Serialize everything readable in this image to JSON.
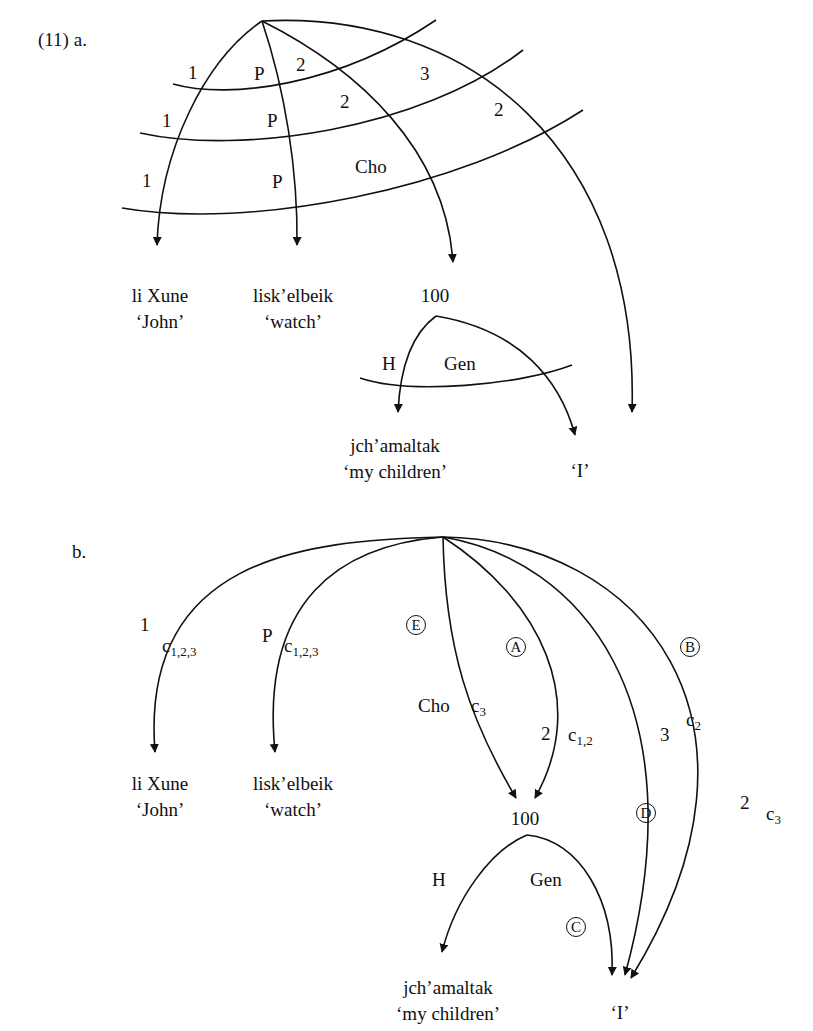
{
  "figure": {
    "example_number": "(11)",
    "a": {
      "label": "a.",
      "arc_labels": {
        "s1_1": "1",
        "s1_P": "P",
        "s1_2": "2",
        "s2_1": "1",
        "s2_P": "P",
        "s2_2": "2",
        "s2_3": "3",
        "s3_1": "1",
        "s3_P": "P",
        "s3_Cho": "Cho",
        "s3_2": "2",
        "H": "H",
        "Gen": "Gen"
      },
      "nodes": {
        "john": {
          "word": "li Xune",
          "gloss": "‘John’"
        },
        "watch": {
          "word": "lisk’elbeik",
          "gloss": "‘watch’"
        },
        "num": {
          "word": "100"
        },
        "children": {
          "word": "jch’amaltak",
          "gloss": "‘my children’"
        },
        "i": {
          "word": "‘I’"
        }
      }
    },
    "b": {
      "label": "b.",
      "arc_labels": {
        "one": "1",
        "one_c": "c",
        "one_sub": "1,2,3",
        "P": "P",
        "P_c": "c",
        "P_sub": "1,2,3",
        "E": "E",
        "Cho": "Cho",
        "Cho_c": "c",
        "Cho_sub": "3",
        "A": "A",
        "two": "2",
        "two_c": "c",
        "two_sub": "1,2",
        "three": "3",
        "three_c": "c",
        "three_sub": "2",
        "D": "D",
        "B": "B",
        "two_b": "2",
        "two_b_c": "c",
        "two_b_sub": "3",
        "H": "H",
        "Gen": "Gen",
        "C": "C"
      },
      "nodes": {
        "john": {
          "word": "li Xune",
          "gloss": "‘John’"
        },
        "watch": {
          "word": "lisk’elbeik",
          "gloss": "‘watch’"
        },
        "num": {
          "word": "100"
        },
        "children": {
          "word": "jch’amaltak",
          "gloss": "‘my children’"
        },
        "i": {
          "word": "‘I’"
        }
      }
    }
  }
}
